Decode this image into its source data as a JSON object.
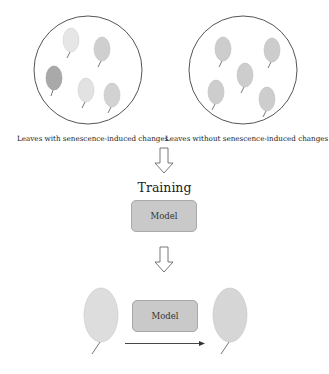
{
  "diagram": {
    "groups": [
      {
        "id": "senescent",
        "caption": "Leaves with senescence-induced changes",
        "leaf_colors": [
          "#e6e6e6",
          "#cfcfcf",
          "#a9a9a9",
          "#e2e2e2",
          "#d2d2d2"
        ]
      },
      {
        "id": "non-senescent",
        "caption": "Leaves without senescence-induced changes",
        "leaf_colors": [
          "#cdcdcd",
          "#cdcdcd",
          "#cdcdcd",
          "#cdcdcd",
          "#cdcdcd"
        ]
      }
    ],
    "training_label": "Training",
    "model_label_top": "Model",
    "model_label_bottom": "Model",
    "colors": {
      "circle_stroke": "#555555",
      "model_fill": "#c9c9c9",
      "model_stroke": "#a8a8a8",
      "input_leaf_fill": "#dddddd",
      "output_leaf_fill": "#d6d6d6",
      "arrow_stroke": "#333333"
    }
  }
}
